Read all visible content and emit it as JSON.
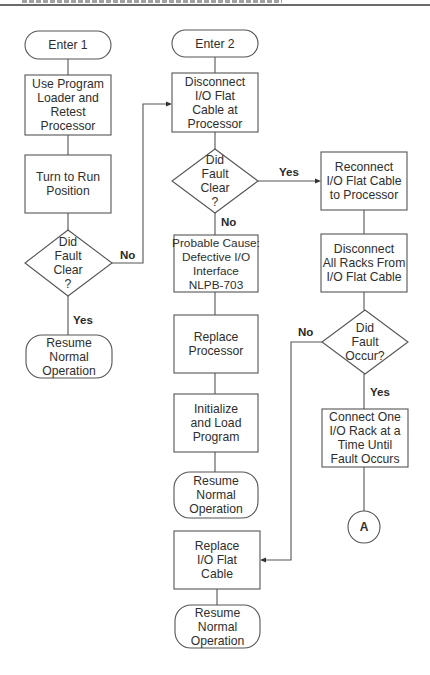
{
  "flowchart": {
    "nodes": {
      "enter1": {
        "type": "terminator",
        "text": "Enter 1"
      },
      "use_program_loader": {
        "type": "process",
        "text": "Use Program\nLoader and\nRetest\nProcessor"
      },
      "turn_to_run": {
        "type": "process",
        "text": "Turn to Run\nPosition"
      },
      "did_fault_clear_1": {
        "type": "decision",
        "text": "Did\nFault\nClear\n?"
      },
      "resume_1": {
        "type": "terminator",
        "text": "Resume\nNormal\nOperation"
      },
      "enter2": {
        "type": "terminator",
        "text": "Enter 2"
      },
      "disconnect_io_cable": {
        "type": "process",
        "text": "Disconnect\nI/O Flat\nCable at\nProcessor"
      },
      "did_fault_clear_2": {
        "type": "decision",
        "text": "Did\nFault\nClear\n?"
      },
      "probable_cause": {
        "type": "process",
        "text": "Probable Cause:\nDefective I/O\nInterface\nNLPB-703"
      },
      "replace_processor": {
        "type": "process",
        "text": "Replace\nProcessor"
      },
      "initialize_load": {
        "type": "process",
        "text": "Initialize\nand Load\nProgram"
      },
      "resume_2": {
        "type": "terminator",
        "text": "Resume\nNormal\nOperation"
      },
      "reconnect_io_cable": {
        "type": "process",
        "text": "Reconnect\nI/O Flat Cable\nto Processor"
      },
      "disconnect_all_racks": {
        "type": "process",
        "text": "Disconnect\nAll Racks From\nI/O Flat Cable"
      },
      "did_fault_occur": {
        "type": "decision",
        "text": "Did\nFault\nOccur?"
      },
      "connect_one_rack": {
        "type": "process",
        "text": "Connect One\nI/O Rack at a\nTime Until\nFault Occurs"
      },
      "connector_a": {
        "type": "connector",
        "text": "A"
      },
      "replace_io_cable": {
        "type": "process",
        "text": "Replace\nI/O Flat\nCable"
      },
      "resume_3": {
        "type": "terminator",
        "text": "Resume\nNormal\nOperation"
      }
    },
    "edge_labels": {
      "no_1": "No",
      "yes_1": "Yes",
      "yes_2": "Yes",
      "no_2": "No",
      "no_3": "No",
      "yes_3": "Yes"
    },
    "edges": [
      {
        "from": "enter1",
        "to": "use_program_loader"
      },
      {
        "from": "use_program_loader",
        "to": "turn_to_run"
      },
      {
        "from": "turn_to_run",
        "to": "did_fault_clear_1"
      },
      {
        "from": "did_fault_clear_1",
        "to": "resume_1",
        "label": "Yes"
      },
      {
        "from": "did_fault_clear_1",
        "to": "disconnect_io_cable",
        "label": "No"
      },
      {
        "from": "enter2",
        "to": "disconnect_io_cable"
      },
      {
        "from": "disconnect_io_cable",
        "to": "did_fault_clear_2"
      },
      {
        "from": "did_fault_clear_2",
        "to": "reconnect_io_cable",
        "label": "Yes"
      },
      {
        "from": "did_fault_clear_2",
        "to": "probable_cause",
        "label": "No"
      },
      {
        "from": "probable_cause",
        "to": "replace_processor"
      },
      {
        "from": "replace_processor",
        "to": "initialize_load"
      },
      {
        "from": "initialize_load",
        "to": "resume_2"
      },
      {
        "from": "reconnect_io_cable",
        "to": "disconnect_all_racks"
      },
      {
        "from": "disconnect_all_racks",
        "to": "did_fault_occur"
      },
      {
        "from": "did_fault_occur",
        "to": "connect_one_rack",
        "label": "Yes"
      },
      {
        "from": "did_fault_occur",
        "to": "replace_io_cable",
        "label": "No"
      },
      {
        "from": "connect_one_rack",
        "to": "connector_a"
      },
      {
        "from": "replace_io_cable",
        "to": "resume_3"
      }
    ]
  }
}
